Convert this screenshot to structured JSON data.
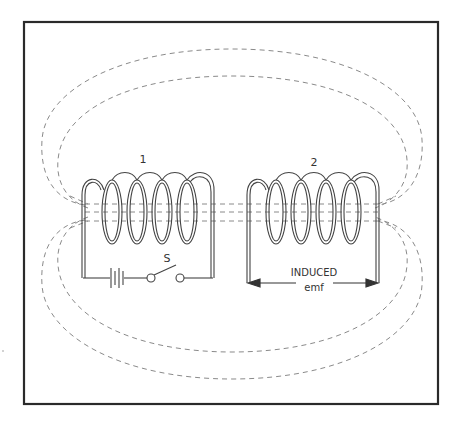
{
  "diagram": {
    "coil1": {
      "label": "1"
    },
    "coil2": {
      "label": "2"
    },
    "switch": {
      "label": "S"
    },
    "induced": {
      "line1": "INDUCED",
      "line2": "emf"
    },
    "colors": {
      "frame": "#2a2a2a",
      "wire": "#444444",
      "field": "#8a8a8a",
      "background": "#ffffff"
    }
  }
}
